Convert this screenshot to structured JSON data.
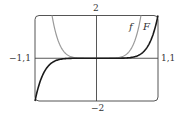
{
  "chart_data": {
    "type": "line",
    "title": "",
    "xlabel": "",
    "ylabel": "",
    "xlim": [
      -1,
      1
    ],
    "ylim": [
      -2,
      2
    ],
    "grid": false,
    "legend": "inline labels near top-right of curves",
    "tick_labels": {
      "top": "2",
      "bottom": "-2",
      "left": "-1,1",
      "right": "1,1"
    },
    "series": [
      {
        "name": "f",
        "color": "#999999",
        "style": "gray curve, even, U-shaped, flat near 0",
        "x": [
          -0.723,
          -0.7,
          -0.6,
          -0.5,
          -0.4,
          -0.2,
          0,
          0.2,
          0.4,
          0.5,
          0.6,
          0.7,
          0.723
        ],
        "y": [
          2.0,
          1.65,
          0.65,
          0.22,
          0.06,
          0.0,
          0,
          0.0,
          0.06,
          0.22,
          0.65,
          1.65,
          2.0
        ]
      },
      {
        "name": "F",
        "color": "#222222",
        "style": "black curve, odd, flat near 0, passes through origin",
        "x": [
          -1,
          -0.95,
          -0.9,
          -0.8,
          -0.7,
          -0.6,
          -0.4,
          0,
          0.4,
          0.6,
          0.7,
          0.8,
          0.9,
          0.95,
          1
        ],
        "y": [
          -2,
          -1.4,
          -0.96,
          -0.42,
          -0.16,
          -0.06,
          -0.003,
          0,
          0.003,
          0.06,
          0.16,
          0.42,
          0.96,
          1.4,
          2
        ]
      }
    ]
  },
  "labels": {
    "y_top": "2",
    "y_bottom": "−2",
    "x_left": "−1,1",
    "x_right": "1,1",
    "curve_f": "f",
    "curve_F": "F"
  },
  "colors": {
    "frame": "#555555",
    "axes": "#444444",
    "f": "#9a9a9a",
    "F": "#1a1a1a"
  }
}
